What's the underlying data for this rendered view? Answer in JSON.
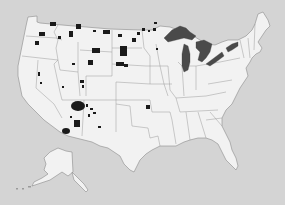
{
  "map": {
    "subject": "Contiguous United States and Alaska",
    "colors": {
      "background": "#d4d4d4",
      "land": "#f2f2f2",
      "state_border": "#9a9a9a",
      "highlighted_area": "#1a1a1a",
      "great_lakes": "#4a4a4a"
    },
    "legend": null,
    "title": null,
    "features": {
      "highlighted_regions": [
        "Washington",
        "Idaho",
        "Montana",
        "North Dakota",
        "South Dakota",
        "Wyoming",
        "Nevada",
        "Utah",
        "Arizona",
        "New Mexico",
        "Oklahoma",
        "Minnesota",
        "Wisconsin",
        "Florida"
      ],
      "great_lakes": [
        "Superior",
        "Michigan",
        "Huron",
        "Erie",
        "Ontario"
      ],
      "inset": "Alaska"
    }
  }
}
